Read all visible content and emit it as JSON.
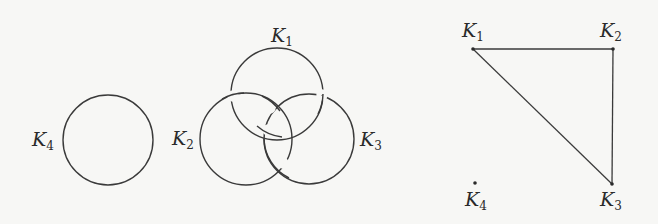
{
  "figure": {
    "link_diagram": {
      "components": [
        {
          "id": "K1",
          "label": "K",
          "sub": "1",
          "cx": 277,
          "cy": 94,
          "r": 46
        },
        {
          "id": "K2",
          "label": "K",
          "sub": "2",
          "cx": 246,
          "cy": 139,
          "r": 46
        },
        {
          "id": "K3",
          "label": "K",
          "sub": "3",
          "cx": 309,
          "cy": 139,
          "r": 45
        },
        {
          "id": "K4",
          "label": "K",
          "sub": "4",
          "cx": 108,
          "cy": 140,
          "r": 45
        }
      ]
    },
    "linking_graph": {
      "vertices": [
        {
          "id": "K1",
          "label": "K",
          "sub": "1",
          "x": 473,
          "y": 49
        },
        {
          "id": "K2",
          "label": "K",
          "sub": "2",
          "x": 613,
          "y": 49
        },
        {
          "id": "K3",
          "label": "K",
          "sub": "3",
          "x": 612,
          "y": 184
        },
        {
          "id": "K4",
          "label": "K",
          "sub": "4",
          "x": 475,
          "y": 183
        }
      ],
      "edges": [
        [
          "K1",
          "K2"
        ],
        [
          "K2",
          "K3"
        ],
        [
          "K1",
          "K3"
        ]
      ]
    }
  }
}
